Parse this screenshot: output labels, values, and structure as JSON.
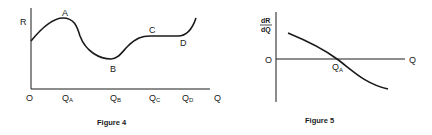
{
  "figures": [
    {
      "caption": "Figure 4",
      "y_label": "R",
      "origin_label": "O",
      "x_label": "Q",
      "x_ticks": [
        {
          "main": "Q",
          "sub": "A"
        },
        {
          "main": "Q",
          "sub": "B"
        },
        {
          "main": "Q",
          "sub": "C"
        },
        {
          "main": "Q",
          "sub": "D"
        }
      ],
      "points": [
        "A",
        "B",
        "C",
        "D"
      ],
      "description": "Revenue R as a function of quantity Q: rises to maximum at A, falls to minimum at B, rises to C, flat to D, then rises"
    },
    {
      "caption": "Figure 5",
      "y_label_numerator": "dR",
      "y_label_denominator": "dQ",
      "origin_label": "O",
      "x_label": "Q",
      "crossing_tick": {
        "main": "Q",
        "sub": "A"
      },
      "description": "Marginal revenue dR/dQ declining, crossing zero at Q_A"
    }
  ],
  "colors": {
    "ink": "#1a1a1a",
    "background": "#ffffff"
  }
}
